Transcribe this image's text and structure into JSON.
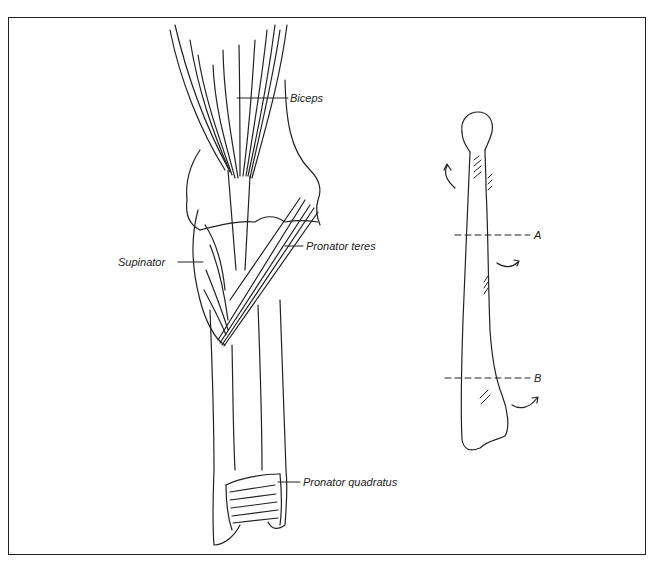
{
  "figure": {
    "type": "anatomical-illustration",
    "labels": {
      "biceps": "Biceps",
      "supinator": "Supinator",
      "pronator_teres": "Pronator teres",
      "pronator_quadratus": "Pronator quadratus",
      "section_a": "A",
      "section_b": "B"
    },
    "colors": {
      "ink": "#222222",
      "background": "#ffffff"
    }
  }
}
